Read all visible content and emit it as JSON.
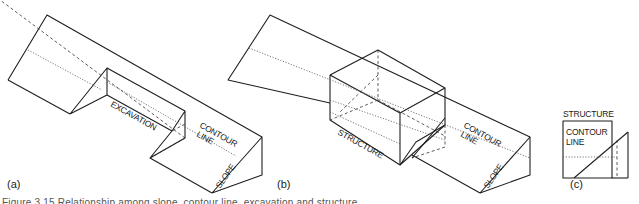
{
  "figure": {
    "caption": "Figure 3.15 Relationship among slope, contour line, excavation and structure",
    "panels": [
      {
        "id": "a",
        "label": "(a)",
        "annotations": [
          "EXCAVATION",
          "CONTOUR",
          "LINE",
          "SLOPE"
        ]
      },
      {
        "id": "b",
        "label": "(b)",
        "annotations": [
          "STRUCTURE",
          "CONTOUR",
          "LINE",
          "SLOPE"
        ]
      },
      {
        "id": "c",
        "label": "(c)",
        "annotations": [
          "STRUCTURE",
          "CONTOUR",
          "LINE"
        ]
      }
    ]
  }
}
